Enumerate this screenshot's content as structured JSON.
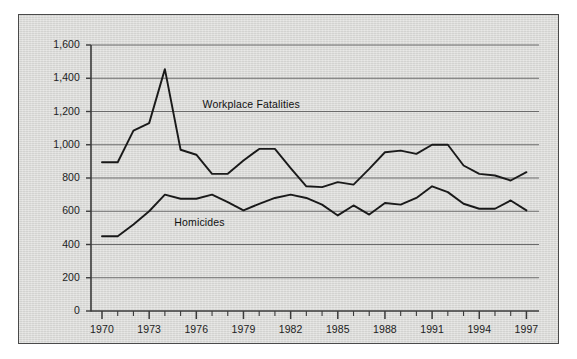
{
  "chart_data": {
    "type": "line",
    "title": "",
    "subtitle": "",
    "xlabel": "",
    "ylabel": "",
    "xlim": [
      1969.3,
      1997.8
    ],
    "ylim": [
      0,
      1600
    ],
    "grid": true,
    "grid_axis": "y",
    "legend": "inline-labels",
    "x": [
      1970,
      1971,
      1972,
      1973,
      1974,
      1975,
      1976,
      1977,
      1978,
      1979,
      1980,
      1981,
      1982,
      1983,
      1984,
      1985,
      1986,
      1987,
      1988,
      1989,
      1990,
      1991,
      1992,
      1993,
      1994,
      1995,
      1996,
      1997
    ],
    "xticks": [
      1970,
      1973,
      1976,
      1979,
      1982,
      1985,
      1988,
      1991,
      1994,
      1997
    ],
    "xticklabels": [
      "1970",
      "1973",
      "1976",
      "1979",
      "1982",
      "1985",
      "1988",
      "1991",
      "1994",
      "1997"
    ],
    "xminorticks_every": 1,
    "yticks": [
      0,
      200,
      400,
      600,
      800,
      1000,
      1200,
      1400,
      1600
    ],
    "yticklabels": [
      "0",
      "200",
      "400",
      "600",
      "800",
      "1,000",
      "1,200",
      "1,400",
      "1,600"
    ],
    "series": [
      {
        "name": "Workplace Fatalities",
        "label_x": 1976.4,
        "label_y": 1237,
        "color": "#1a1a1a",
        "values": [
          895,
          895,
          1085,
          1130,
          1455,
          970,
          940,
          825,
          825,
          905,
          975,
          975,
          860,
          750,
          745,
          775,
          760,
          855,
          955,
          965,
          945,
          1000,
          1000,
          875,
          825,
          815,
          785,
          835
        ]
      },
      {
        "name": "Homicides",
        "label_x": 1974.6,
        "label_y": 527,
        "color": "#1a1a1a",
        "values": [
          450,
          450,
          520,
          600,
          700,
          675,
          675,
          700,
          655,
          605,
          645,
          680,
          700,
          680,
          640,
          575,
          635,
          580,
          650,
          640,
          680,
          750,
          715,
          645,
          615,
          615,
          665,
          605
        ]
      }
    ]
  },
  "style": {
    "panel_background": "#d7d7d4",
    "panel_border": "#4a4a4a",
    "grid_color": "#6b6b6b",
    "axis_color": "#3a3a3a",
    "text_color": "#1d1d1d",
    "page_background": "#ffffff"
  }
}
